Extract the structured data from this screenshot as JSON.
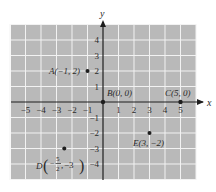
{
  "chart_data": {
    "type": "scatter",
    "title": "",
    "xlabel": "x",
    "ylabel": "y",
    "xlim": [
      -6,
      6
    ],
    "ylim": [
      -5,
      5
    ],
    "grid": true,
    "x_ticks": [
      -5,
      -4,
      -3,
      -2,
      -1,
      1,
      2,
      3,
      4,
      5
    ],
    "y_ticks": [
      4,
      3,
      2,
      1,
      -1,
      -2,
      -3,
      -4
    ],
    "points": [
      {
        "name": "A",
        "x": -1,
        "y": 2,
        "label": "A(−1, 2)"
      },
      {
        "name": "B",
        "x": 0,
        "y": 0,
        "label": "B(0, 0)"
      },
      {
        "name": "C",
        "x": 5,
        "y": 0,
        "label": "C(5, 0)"
      },
      {
        "name": "D",
        "x": -2.5,
        "y": -3,
        "label": "D(−5/2, −3)"
      },
      {
        "name": "E",
        "x": 3,
        "y": -2,
        "label": "E(3, −2)"
      }
    ]
  },
  "colors": {
    "grid_bg": "#b9b9b9",
    "grid_line": "#f2f2f2",
    "axis": "#1e1e1e",
    "point": "#1e1e1e",
    "text": "#2a2a2a"
  },
  "labels": {
    "x_axis": "x",
    "y_axis": "y",
    "A": "A(−1, 2)",
    "B": "B(0, 0)",
    "C": "C(5, 0)",
    "D_prefix": "D",
    "D_frac_num": "5",
    "D_frac_den": "2",
    "D_minus": "−",
    "D_y": "−3",
    "E": "E(3, −2)"
  }
}
